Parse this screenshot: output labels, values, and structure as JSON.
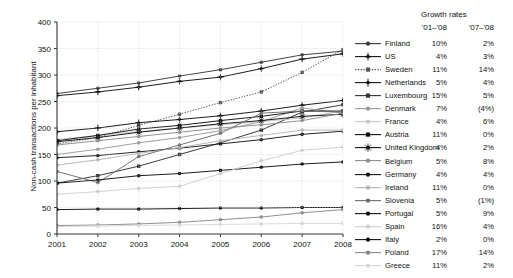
{
  "axes": {
    "ylabel": "Non-cash transactions per inhabitant",
    "yticks": [
      "0",
      "50",
      "100",
      "150",
      "200",
      "250",
      "300",
      "350",
      "400"
    ],
    "xticks": [
      "2001",
      "2002",
      "2003",
      "2004",
      "2005",
      "2006",
      "2007",
      "2008"
    ]
  },
  "legend": {
    "title": "Growth rates",
    "col1": "'01–'08",
    "col2": "'07–'08"
  },
  "chart_data": {
    "type": "line",
    "title": "",
    "xlabel": "",
    "ylabel": "Non-cash transactions per inhabitant",
    "x": [
      2001,
      2002,
      2003,
      2004,
      2005,
      2006,
      2007,
      2008
    ],
    "ylim": [
      0,
      400
    ],
    "xlim": [
      2001,
      2008
    ],
    "grid": true,
    "legend_position": "right",
    "series": [
      {
        "name": "Finland",
        "growth_01_08": "10%",
        "growth_07_08": "2%",
        "color": "#3a3a3a",
        "line": "solid",
        "marker": "circle",
        "values": [
          265,
          275,
          285,
          298,
          310,
          324,
          338,
          345
        ]
      },
      {
        "name": "US",
        "growth_01_08": "4%",
        "growth_07_08": "3%",
        "color": "#111111",
        "line": "solid",
        "marker": "plus",
        "values": [
          261,
          268,
          277,
          288,
          296,
          312,
          330,
          340
        ]
      },
      {
        "name": "Sweden",
        "growth_01_08": "11%",
        "growth_07_08": "14%",
        "color": "#555555",
        "line": "dotted",
        "marker": "square",
        "values": [
          170,
          182,
          205,
          226,
          248,
          268,
          305,
          348
        ]
      },
      {
        "name": "Netherlands",
        "growth_01_08": "5%",
        "growth_07_08": "4%",
        "color": "#111111",
        "line": "solid",
        "marker": "plus",
        "values": [
          193,
          200,
          210,
          216,
          223,
          232,
          243,
          252
        ]
      },
      {
        "name": "Luxembourg",
        "growth_01_08": "15%",
        "growth_07_08": "5%",
        "color": "#333333",
        "line": "solid",
        "marker": "square",
        "values": [
          96,
          110,
          128,
          150,
          172,
          196,
          230,
          244
        ]
      },
      {
        "name": "Denmark",
        "growth_01_08": "7%",
        "growth_07_08": "(4%)",
        "color": "#9a9a9a",
        "line": "solid",
        "marker": "circle",
        "values": [
          150,
          160,
          172,
          182,
          195,
          212,
          238,
          228
        ]
      },
      {
        "name": "France",
        "growth_01_08": "4%",
        "growth_07_08": "6%",
        "color": "#c6c6c6",
        "line": "solid",
        "marker": "circle",
        "values": [
          178,
          186,
          193,
          200,
          206,
          212,
          219,
          232
        ]
      },
      {
        "name": "Austria",
        "growth_01_08": "11%",
        "growth_07_08": "0%",
        "color": "#111111",
        "line": "solid",
        "marker": "square",
        "values": [
          176,
          186,
          198,
          205,
          214,
          222,
          232,
          232
        ]
      },
      {
        "name": "United Kingdom",
        "growth_01_08": "4%",
        "growth_07_08": "2%",
        "color": "#111111",
        "line": "solid",
        "marker": "star",
        "values": [
          174,
          182,
          192,
          200,
          208,
          214,
          222,
          226
        ]
      },
      {
        "name": "Belgium",
        "growth_01_08": "5%",
        "growth_07_08": "8%",
        "color": "#8c8c8c",
        "line": "solid",
        "marker": "circle",
        "values": [
          168,
          176,
          184,
          192,
          200,
          206,
          214,
          228
        ]
      },
      {
        "name": "Germany",
        "growth_01_08": "4%",
        "growth_07_08": "4%",
        "color": "#1a1a1a",
        "line": "solid",
        "marker": "circle",
        "values": [
          144,
          148,
          155,
          162,
          170,
          178,
          188,
          194
        ]
      },
      {
        "name": "Ireland",
        "growth_01_08": "11%",
        "growth_07_08": "0%",
        "color": "#b4b4b4",
        "line": "solid",
        "marker": "circle",
        "values": [
          130,
          140,
          152,
          163,
          176,
          186,
          196,
          196
        ]
      },
      {
        "name": "Slovenia",
        "growth_01_08": "5%",
        "growth_07_08": "(1%)",
        "color": "#6e6e6e",
        "line": "solid",
        "marker": "circle",
        "values": [
          118,
          97,
          146,
          168,
          190,
          228,
          232,
          230
        ]
      },
      {
        "name": "Portugal",
        "growth_01_08": "5%",
        "growth_07_08": "9%",
        "color": "#111111",
        "line": "solid",
        "marker": "circle",
        "values": [
          96,
          102,
          110,
          114,
          120,
          126,
          132,
          136
        ]
      },
      {
        "name": "Spain",
        "growth_01_08": "16%",
        "growth_07_08": "4%",
        "color": "#cfcfcf",
        "line": "solid",
        "marker": "circle",
        "values": [
          75,
          80,
          86,
          90,
          114,
          138,
          158,
          164
        ]
      },
      {
        "name": "Italy",
        "growth_01_08": "2%",
        "growth_07_08": "0%",
        "color": "#111111",
        "line": "solid",
        "marker": "circle",
        "values": [
          46,
          47,
          47,
          48,
          49,
          49,
          50,
          50
        ]
      },
      {
        "name": "Poland",
        "growth_01_08": "17%",
        "growth_07_08": "14%",
        "color": "#8a8a8a",
        "line": "solid",
        "marker": "circle",
        "values": [
          16,
          17,
          19,
          22,
          27,
          32,
          40,
          46
        ]
      },
      {
        "name": "Greece",
        "growth_01_08": "11%",
        "growth_07_08": "2%",
        "color": "#d8d8d8",
        "line": "solid",
        "marker": "circle",
        "values": [
          14,
          15,
          16,
          17,
          18,
          19,
          20,
          20
        ]
      }
    ]
  }
}
